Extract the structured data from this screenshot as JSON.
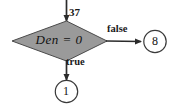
{
  "diagram": {
    "type": "flowchart",
    "incoming_edge": {
      "label": "37",
      "name": "input-edge-37"
    },
    "decision": {
      "text": "Den  =  0",
      "variable": "Den",
      "operator": "=",
      "operand": "0",
      "shape": "diamond",
      "fill_color": "#9a9a9a",
      "stroke_color": "#4a4a4a"
    },
    "branches": [
      {
        "label": "false",
        "direction": "right",
        "target": "8"
      },
      {
        "label": "true",
        "direction": "down",
        "target": "1"
      }
    ],
    "terminals": [
      {
        "label": "8",
        "shape": "circle",
        "fill_color": "#ffffff",
        "stroke_color": "#3a3a3a"
      },
      {
        "label": "1",
        "shape": "circle",
        "fill_color": "#ffffff",
        "stroke_color": "#3a3a3a"
      }
    ],
    "colors": {
      "background": "#ffffff",
      "line": "#2b2b2b",
      "text": "#111111"
    }
  }
}
